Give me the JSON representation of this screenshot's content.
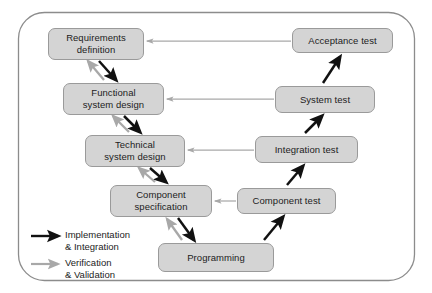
{
  "diagram": {
    "frame": {
      "border_color": "#8c8c8c",
      "background": "#ffffff"
    },
    "box_style": {
      "fill": "#d4d4d4",
      "stroke": "#9a9a9a",
      "text_color": "#1c1c1c"
    },
    "nodes": [
      {
        "id": "requirements-definition",
        "label": "Requirements\ndefinition",
        "side": "left",
        "level": 1,
        "x": 48,
        "y": 28,
        "w": 96,
        "h": 32
      },
      {
        "id": "functional-system-design",
        "label": "Functional\nsystem design",
        "side": "left",
        "level": 2,
        "x": 63,
        "y": 83,
        "w": 101,
        "h": 32
      },
      {
        "id": "technical-system-design",
        "label": "Technical\nsystem design",
        "side": "left",
        "level": 3,
        "x": 85,
        "y": 135,
        "w": 100,
        "h": 32
      },
      {
        "id": "component-specification",
        "label": "Component\nspecification",
        "side": "left",
        "level": 4,
        "x": 110,
        "y": 185,
        "w": 102,
        "h": 32
      },
      {
        "id": "programming",
        "label": "Programming",
        "side": "bottom",
        "level": 5,
        "x": 158,
        "y": 243,
        "w": 116,
        "h": 29
      },
      {
        "id": "component-test",
        "label": "Component test",
        "side": "right",
        "level": 4,
        "x": 237,
        "y": 188,
        "w": 99,
        "h": 26
      },
      {
        "id": "integration-test",
        "label": "Integration test",
        "side": "right",
        "level": 3,
        "x": 255,
        "y": 136,
        "w": 103,
        "h": 27
      },
      {
        "id": "system-test",
        "label": "System test",
        "side": "right",
        "level": 2,
        "x": 275,
        "y": 86,
        "w": 100,
        "h": 27
      },
      {
        "id": "acceptance-test",
        "label": "Acceptance test",
        "side": "right",
        "level": 1,
        "x": 292,
        "y": 28,
        "w": 101,
        "h": 25
      }
    ],
    "edges": [
      {
        "id": "req-to-functional",
        "from": "requirements-definition",
        "to": "functional-system-design",
        "kind": "implementation"
      },
      {
        "id": "functional-to-technical",
        "from": "functional-system-design",
        "to": "technical-system-design",
        "kind": "implementation"
      },
      {
        "id": "technical-to-component-spec",
        "from": "technical-system-design",
        "to": "component-specification",
        "kind": "implementation"
      },
      {
        "id": "component-spec-to-programming",
        "from": "component-specification",
        "to": "programming",
        "kind": "implementation"
      },
      {
        "id": "programming-to-component-test",
        "from": "programming",
        "to": "component-test",
        "kind": "implementation"
      },
      {
        "id": "component-test-to-integration-test",
        "from": "component-test",
        "to": "integration-test",
        "kind": "implementation"
      },
      {
        "id": "integration-test-to-system-test",
        "from": "integration-test",
        "to": "system-test",
        "kind": "implementation"
      },
      {
        "id": "system-test-to-acceptance-test",
        "from": "system-test",
        "to": "acceptance-test",
        "kind": "implementation"
      },
      {
        "id": "functional-to-req-verify",
        "from": "functional-system-design",
        "to": "requirements-definition",
        "kind": "verification"
      },
      {
        "id": "technical-to-functional-verify",
        "from": "technical-system-design",
        "to": "functional-system-design",
        "kind": "verification"
      },
      {
        "id": "component-spec-to-technical-verify",
        "from": "component-specification",
        "to": "technical-system-design",
        "kind": "verification"
      },
      {
        "id": "programming-to-component-spec-verify",
        "from": "programming",
        "to": "component-specification",
        "kind": "verification"
      },
      {
        "id": "acceptance-to-requirements-verify",
        "from": "acceptance-test",
        "to": "requirements-definition",
        "kind": "verification"
      },
      {
        "id": "system-test-to-functional-verify",
        "from": "system-test",
        "to": "functional-system-design",
        "kind": "verification"
      },
      {
        "id": "integration-test-to-technical-verify",
        "from": "integration-test",
        "to": "technical-system-design",
        "kind": "verification"
      },
      {
        "id": "component-test-to-component-spec-verify",
        "from": "component-test",
        "to": "component-specification",
        "kind": "verification"
      }
    ]
  },
  "legend": {
    "items": [
      {
        "id": "implementation",
        "label": "Implementation\n& Integration",
        "color": "#111111",
        "arrow_style": "solid-black"
      },
      {
        "id": "verification",
        "label": "Verification\n& Validation",
        "color": "#a8a8a8",
        "arrow_style": "solid-gray"
      }
    ]
  }
}
